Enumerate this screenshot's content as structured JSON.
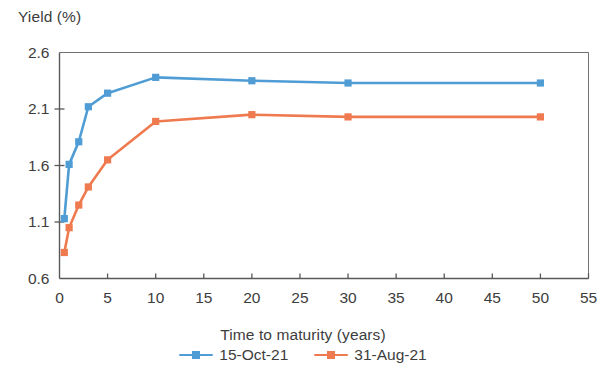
{
  "chart_data": {
    "type": "line",
    "title": "",
    "ylabel": "Yield (%)",
    "xlabel": "Time to maturity (years)",
    "xlim": [
      0,
      55
    ],
    "ylim": [
      0.6,
      2.6
    ],
    "xticks": [
      "0",
      "5",
      "10",
      "15",
      "20",
      "25",
      "30",
      "35",
      "40",
      "45",
      "50",
      "55"
    ],
    "xtick_values": [
      0,
      5,
      10,
      15,
      20,
      25,
      30,
      35,
      40,
      45,
      50,
      55
    ],
    "yticks": [
      "0.6",
      "1.1",
      "1.6",
      "2.1",
      "2.6"
    ],
    "ytick_values": [
      0.6,
      1.1,
      1.6,
      2.1,
      2.6
    ],
    "grid": false,
    "legend_position": "bottom",
    "x": [
      0.5,
      1,
      2,
      3,
      5,
      10,
      20,
      30,
      50
    ],
    "series": [
      {
        "name": "15-Oct-21",
        "color": "#4f9dd4",
        "marker": "square",
        "values": [
          1.13,
          1.61,
          1.81,
          2.12,
          2.24,
          2.38,
          2.35,
          2.33,
          2.33
        ]
      },
      {
        "name": "31-Aug-21",
        "color": "#ef7a4f",
        "marker": "square",
        "values": [
          0.83,
          1.05,
          1.25,
          1.41,
          1.65,
          1.99,
          2.05,
          2.03,
          2.03
        ]
      }
    ]
  },
  "axis": {
    "line_color": "#59595b"
  }
}
